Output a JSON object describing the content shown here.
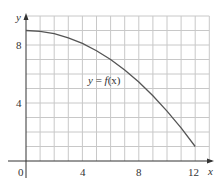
{
  "chart_data": {
    "type": "line",
    "title": "",
    "xlabel": "x",
    "ylabel": "y",
    "xlim": [
      0,
      13
    ],
    "ylim": [
      0,
      10
    ],
    "grid": true,
    "x_ticks": [
      0,
      4,
      8,
      12
    ],
    "y_ticks": [
      4,
      8
    ],
    "x_tick_labels": [
      "0",
      "4",
      "8",
      "12"
    ],
    "y_tick_labels": [
      "4",
      "8"
    ],
    "series": [
      {
        "name": "y = f(x)",
        "x": [
          0,
          1,
          2,
          3,
          4,
          5,
          6,
          7,
          8,
          9,
          10,
          11,
          12
        ],
        "values": [
          9.0,
          8.94,
          8.78,
          8.5,
          8.11,
          7.61,
          7.0,
          6.28,
          5.44,
          4.5,
          3.44,
          2.28,
          1.0
        ]
      }
    ],
    "annotations": [
      {
        "text": "y = f(x)",
        "x": 6.5,
        "y": 5.5
      }
    ],
    "colors": {
      "grid": "#c8c8c8",
      "axis": "#333333",
      "curve": "#555555"
    }
  },
  "labels": {
    "x_axis": "x",
    "y_axis": "y",
    "origin": "0",
    "x4": "4",
    "x8": "8",
    "x12": "12",
    "y4": "4",
    "y8": "8",
    "curve_label_y": "y",
    "curve_label_eq": " = ",
    "curve_label_f": "f",
    "curve_label_arg": "(x)"
  }
}
